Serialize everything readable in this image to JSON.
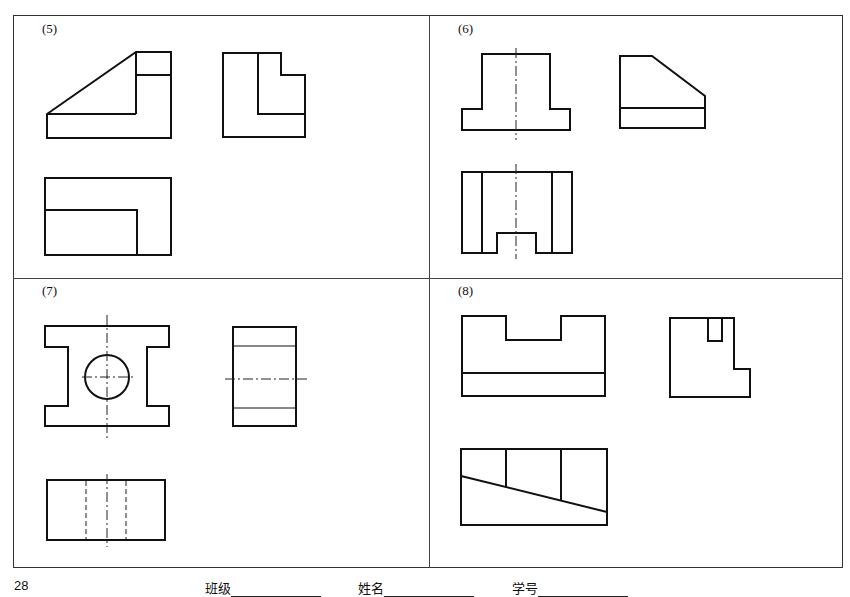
{
  "page": {
    "number": "28",
    "panels": [
      {
        "id": "5",
        "label": "(5)"
      },
      {
        "id": "6",
        "label": "(6)"
      },
      {
        "id": "7",
        "label": "(7)"
      },
      {
        "id": "8",
        "label": "(8)"
      }
    ],
    "footer": {
      "class_label": "班级",
      "name_label": "姓名",
      "student_id_label": "学号"
    }
  },
  "colors": {
    "line": "#111111",
    "frame": "#333333",
    "background": "#ffffff"
  }
}
